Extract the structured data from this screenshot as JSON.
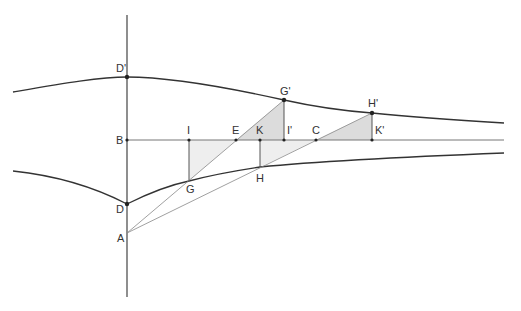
{
  "diagram": {
    "type": "geometric-construction",
    "colors": {
      "stroke": "#333333",
      "shade_light": "#eeeeee",
      "shade_dark": "#dcdcdc",
      "background": "#ffffff"
    },
    "points": {
      "D_prime": {
        "label": "D'",
        "x": 127,
        "y": 77
      },
      "B": {
        "label": "B",
        "x": 127,
        "y": 140
      },
      "D": {
        "label": "D",
        "x": 127,
        "y": 204
      },
      "A": {
        "label": "A",
        "x": 127,
        "y": 233
      },
      "I": {
        "label": "I",
        "x": 189,
        "y": 140
      },
      "G": {
        "label": "G",
        "x": 189,
        "y": 181
      },
      "E": {
        "label": "E",
        "x": 236,
        "y": 140
      },
      "K": {
        "label": "K",
        "x": 260,
        "y": 140
      },
      "H": {
        "label": "H",
        "x": 260,
        "y": 167
      },
      "G_prime": {
        "label": "G'",
        "x": 284,
        "y": 100
      },
      "I_prime": {
        "label": "I'",
        "x": 284,
        "y": 140
      },
      "C": {
        "label": "C",
        "x": 316,
        "y": 140
      },
      "H_prime": {
        "label": "H'",
        "x": 372,
        "y": 113
      },
      "K_prime": {
        "label": "K'",
        "x": 372,
        "y": 140
      }
    }
  }
}
